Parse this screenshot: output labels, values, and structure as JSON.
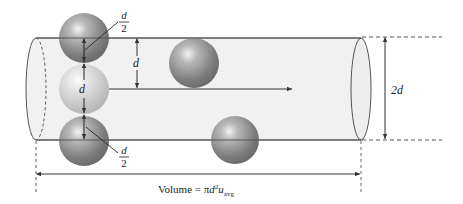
{
  "diagram": {
    "type": "cylinder-collision-volume",
    "labels": {
      "half_top_num": "d",
      "half_top_den": "2",
      "half_bottom_num": "d",
      "half_bottom_den": "2",
      "center_diameter": "d",
      "side_distance": "d",
      "cylinder_diameter": "2d",
      "volume_prefix": "Volume = π",
      "volume_d": "d",
      "volume_exp": "2",
      "volume_u": "u",
      "volume_sub": "avg"
    },
    "colors": {
      "cylinder_fill": "#f1f1f1",
      "line": "#444444",
      "dark_sphere": "#8a8a8a",
      "light_sphere": "#cfcfcf"
    }
  }
}
